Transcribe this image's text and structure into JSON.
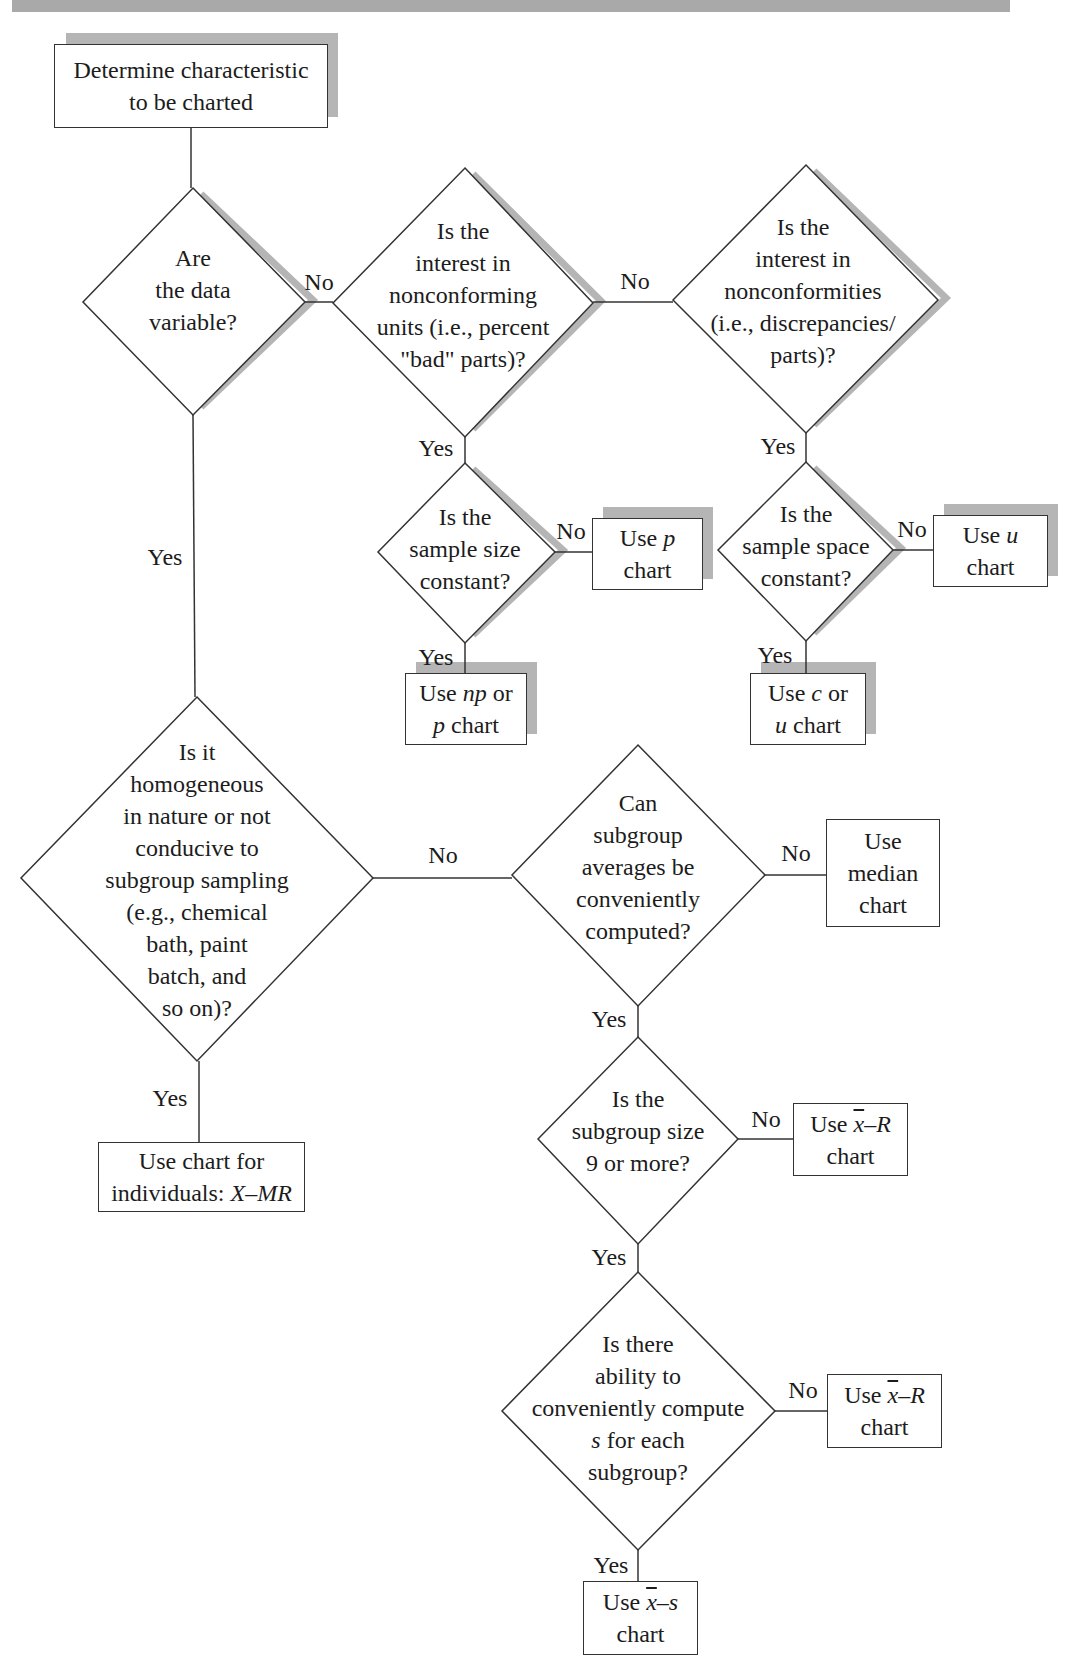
{
  "figure": {
    "banner_color": "#a9a9a9",
    "shadow_color": "#b5b5b5",
    "line_color": "#333333"
  },
  "nodes": {
    "start": {
      "lines": [
        "Determine characteristic",
        "to be charted"
      ]
    },
    "q_variable": {
      "lines": [
        "Are",
        "the data",
        "variable?"
      ]
    },
    "q_nonconforming_units": {
      "lines": [
        "Is the",
        "interest in",
        "nonconforming",
        "units (i.e., percent",
        "\"bad\" parts)?"
      ]
    },
    "q_nonconformities": {
      "lines": [
        "Is the",
        "interest in",
        "nonconformities",
        "(i.e., discrepancies/",
        "parts)?"
      ]
    },
    "q_sample_size": {
      "lines": [
        "Is the",
        "sample size",
        "constant?"
      ]
    },
    "q_sample_space": {
      "lines": [
        "Is the",
        "sample space",
        "constant?"
      ]
    },
    "use_p": {
      "prefix": "Use ",
      "var": "p",
      "suffix": "",
      "line2": "chart"
    },
    "use_u": {
      "prefix": "Use ",
      "var": "u",
      "suffix": "",
      "line2": "chart"
    },
    "use_np_p": {
      "line1_prefix": "Use ",
      "line1_var": "np",
      "line1_suffix": " or",
      "line2_var": "p",
      "line2_suffix": " chart"
    },
    "use_c_u": {
      "line1_prefix": "Use ",
      "line1_var": "c",
      "line1_suffix": " or",
      "line2_var": "u",
      "line2_suffix": " chart"
    },
    "q_homogeneous": {
      "lines": [
        "Is it",
        "homogeneous",
        "in nature or not",
        "conducive to",
        "subgroup sampling",
        "(e.g., chemical",
        "bath, paint",
        "batch, and",
        "so on)?"
      ]
    },
    "q_averages": {
      "lines": [
        "Can",
        "subgroup",
        "averages be",
        "conveniently",
        "computed?"
      ]
    },
    "use_median": {
      "lines": [
        "Use",
        "median",
        "chart"
      ]
    },
    "use_individuals": {
      "line1": "Use chart for",
      "line2_prefix": "individuals: ",
      "line2_var": "X–MR"
    },
    "q_subgroup_size": {
      "lines": [
        "Is the",
        "subgroup size",
        "9 or more?"
      ]
    },
    "use_xbar_r_1": {
      "prefix": "Use ",
      "xbar": "x",
      "suffix_var": "–R",
      "line2": "chart"
    },
    "q_compute_s": {
      "line1": "Is there",
      "line2": "ability to",
      "line3": "conveniently compute",
      "line4_var": "s",
      "line4_suffix": " for each",
      "line5": "subgroup?"
    },
    "use_xbar_r_2": {
      "prefix": "Use ",
      "xbar": "x",
      "suffix_var": "–R",
      "line2": "chart"
    },
    "use_xbar_s": {
      "prefix": "Use ",
      "xbar": "x",
      "suffix_var": "–s",
      "line2": "chart"
    }
  },
  "edge_labels": {
    "variable_no": "No",
    "variable_yes": "Yes",
    "units_no": "No",
    "units_yes": "Yes",
    "nonconf_yes": "Yes",
    "size_no": "No",
    "size_yes": "Yes",
    "space_no": "No",
    "space_yes": "Yes",
    "homog_no": "No",
    "homog_yes": "Yes",
    "avg_no": "No",
    "avg_yes": "Yes",
    "sub9_no": "No",
    "sub9_yes": "Yes",
    "s_no": "No",
    "s_yes": "Yes"
  }
}
